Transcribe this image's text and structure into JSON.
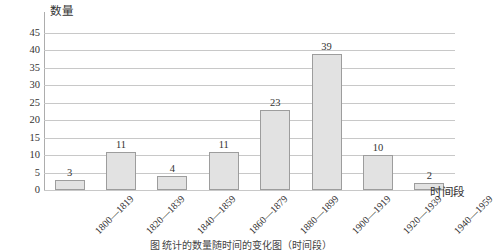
{
  "chart_data": {
    "type": "bar",
    "title": "",
    "xlabel": "时间段",
    "ylabel": "数量",
    "categories": [
      "1800—1819",
      "1820—1839",
      "1840—1859",
      "1860—1879",
      "1880—1899",
      "1900—1919",
      "1920—1939",
      "1940—1959"
    ],
    "values": [
      3,
      11,
      4,
      11,
      23,
      39,
      10,
      2
    ],
    "ylim": [
      0,
      45
    ],
    "ytick_labels": [
      "45",
      "40",
      "35",
      "30",
      "25",
      "20",
      "15",
      "10",
      "5",
      "0"
    ],
    "ytick_values": [
      45,
      40,
      35,
      30,
      25,
      20,
      15,
      10,
      5,
      0
    ],
    "ytick_step": 5,
    "grid": true,
    "legend": "none",
    "data_labels": [
      "3",
      "11",
      "4",
      "11",
      "23",
      "39",
      "10",
      "2"
    ],
    "bar_color": "#e2e2e2",
    "bar_border_color": "#9d9d9d",
    "gridline_color": "#c8c8c8",
    "axis_color": "#adadad",
    "background_color": "#ffffff",
    "xtick_rotation": -45
  },
  "caption": {
    "text": "图    统计的数量随时间的变化图（时间段）"
  }
}
